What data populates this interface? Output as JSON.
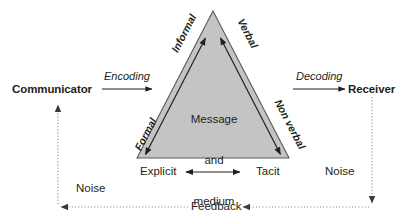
{
  "diagram": {
    "title_center": "Message\nand\nmedium",
    "center_lines": [
      "Message",
      "and",
      "medium"
    ],
    "roles": {
      "communicator": "Communicator",
      "receiver": "Receiver"
    },
    "processes": {
      "encoding": "Encoding",
      "decoding": "Decoding"
    },
    "triangle_edges": {
      "left_top": "Informal",
      "left_bottom": "Formal",
      "right_top": "Verbal",
      "right_bottom": "Non verbal"
    },
    "base_axis": {
      "left": "Explicit",
      "right": "Tacit"
    },
    "noise": {
      "left": "Noise",
      "right": "Noise"
    },
    "feedback": "Feedback",
    "colors": {
      "triangle_fill": "#c4c4c4",
      "triangle_stroke": "#5b5b5b",
      "line": "#231f20",
      "text": "#231f20",
      "dotted": "#808080",
      "background": "#ffffff"
    },
    "geometry": {
      "apex": [
        213,
        11
      ],
      "base_left": [
        137,
        158
      ],
      "base_right": [
        289,
        158
      ]
    }
  }
}
